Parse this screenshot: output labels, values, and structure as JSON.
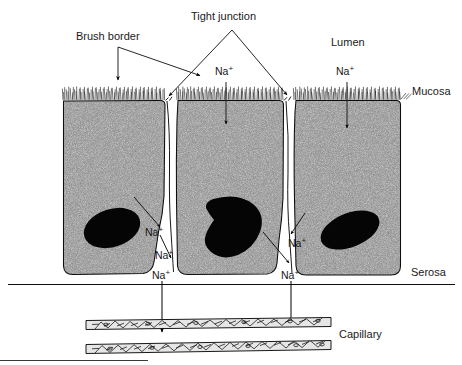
{
  "figure": {
    "type": "biological-diagram",
    "background_color": "#ffffff",
    "ink_color": "#000000",
    "cytoplasm_color": "#b9b9b9",
    "nucleus_color": "#000000"
  },
  "labels": {
    "brush_border": "Brush border",
    "tight_junction": "Tight junction",
    "lumen": "Lumen",
    "mucosa": "Mucosa",
    "serosa": "Serosa",
    "capillary": "Capillary"
  },
  "ions": {
    "symbol": "Na",
    "charge": "+",
    "lumen_left": "Na",
    "lumen_right": "Na",
    "left_space_1": "Na",
    "left_space_2": "Na",
    "left_space_3": "Na",
    "right_space_1": "Na",
    "right_space_2": "Na"
  },
  "structures": {
    "cells": [
      {
        "name": "epithelial-cell-left",
        "x": 62,
        "y": 100,
        "width": 103,
        "height": 175
      },
      {
        "name": "epithelial-cell-middle",
        "x": 176,
        "y": 100,
        "width": 107,
        "height": 175
      },
      {
        "name": "epithelial-cell-right",
        "x": 293,
        "y": 100,
        "width": 107,
        "height": 175
      }
    ],
    "nuclei": [
      {
        "name": "nucleus-left",
        "cx": 112,
        "cy": 228
      },
      {
        "name": "nucleus-middle",
        "cx": 232,
        "cy": 228
      },
      {
        "name": "nucleus-right",
        "cx": 348,
        "cy": 230
      }
    ],
    "brush_border": {
      "y_top": 86,
      "y_bottom": 100
    },
    "serosa_line": {
      "y": 284,
      "x_start": 8,
      "x_end": 455
    },
    "capillary": {
      "upper_wall_y": 321,
      "lower_wall_y": 344,
      "x_start": 85,
      "x_end": 332
    },
    "baseline_rule": {
      "y": 360,
      "x_start": 0,
      "x_end": 148
    }
  }
}
